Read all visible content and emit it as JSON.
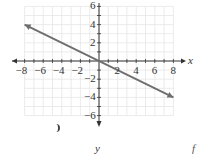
{
  "chart_data": {
    "type": "line",
    "title": "",
    "xlabel": "x",
    "ylabel": "y",
    "xlim": [
      -8,
      8
    ],
    "ylim": [
      -6,
      6
    ],
    "grid": true,
    "x_ticks": [
      -8,
      -6,
      -4,
      -2,
      2,
      4,
      6,
      8
    ],
    "y_ticks": [
      6,
      4,
      2,
      -2,
      -4,
      -6
    ],
    "x_tick_labels": [
      "−8",
      "−6",
      "−4",
      "−2",
      "2",
      "4",
      "6",
      "8"
    ],
    "y_tick_labels": [
      "6",
      "4",
      "2",
      "−2",
      "−4",
      "−6"
    ],
    "series": [
      {
        "name": "line",
        "equation": "y = -x/2",
        "x": [
          -8,
          0,
          8
        ],
        "y": [
          4,
          0,
          -4
        ],
        "arrows": "both"
      }
    ],
    "legend": null
  },
  "labels": {
    "x_axis": "x",
    "y_bottom": "y",
    "corner": "f"
  },
  "colors": {
    "grid": "#e6e6e6",
    "axis": "#333333",
    "line": "#6e6e6e"
  }
}
